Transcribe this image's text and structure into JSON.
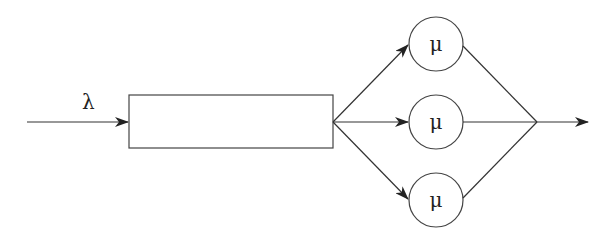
{
  "diagram": {
    "type": "queueing-system",
    "arrival_label": "λ",
    "queue": {
      "label": ""
    },
    "servers": [
      {
        "label": "μ"
      },
      {
        "label": "μ"
      },
      {
        "label": "μ"
      }
    ],
    "colors": {
      "stroke": "#333333",
      "arrow": "#222222",
      "background": "#ffffff"
    }
  }
}
